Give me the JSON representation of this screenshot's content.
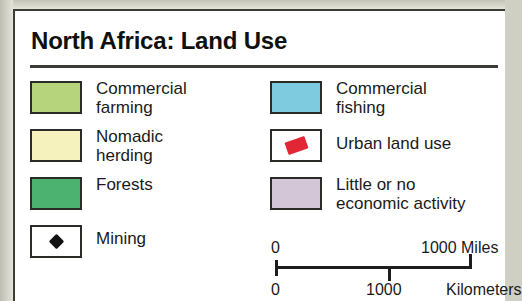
{
  "card": {
    "title": "North Africa: Land Use",
    "background_color": "#ffffff",
    "border_color": "#3d3d38",
    "canvas_color": "#cfcfc4"
  },
  "legend": {
    "left_column": [
      {
        "label": "Commercial\nfarming",
        "swatch_type": "color",
        "color": "#b5d47c",
        "icon": "color-swatch"
      },
      {
        "label": "Nomadic\nherding",
        "swatch_type": "color",
        "color": "#f5f2bd",
        "icon": "color-swatch"
      },
      {
        "label": "Forests",
        "swatch_type": "color",
        "color": "#4cb270",
        "icon": "color-swatch"
      },
      {
        "label": "Mining",
        "swatch_type": "symbol",
        "color": "#ffffff",
        "icon": "diamond-icon",
        "symbol_color": "#111111"
      }
    ],
    "right_column": [
      {
        "label": "Commercial\nfishing",
        "swatch_type": "color",
        "color": "#7ecbdf",
        "icon": "color-swatch"
      },
      {
        "label": "Urban land use",
        "swatch_type": "symbol",
        "color": "#ffffff",
        "icon": "urban-patch-icon",
        "symbol_color": "#e32636"
      },
      {
        "label": "Little or no\neconomic activity",
        "swatch_type": "color",
        "color": "#d3c6d6",
        "icon": "color-swatch"
      }
    ]
  },
  "scale_bar": {
    "miles_min": "0",
    "miles_max": "1000 Miles",
    "km_min": "0",
    "km_mid": "1000",
    "km_unit": "Kilometers"
  }
}
